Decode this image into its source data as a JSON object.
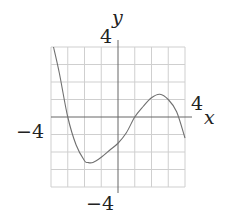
{
  "chart_data": {
    "type": "line",
    "title": "",
    "xlabel": "x",
    "ylabel": "y",
    "xlim": [
      -4,
      4
    ],
    "ylim": [
      -4,
      4
    ],
    "grid": true,
    "grid_step": 1,
    "tick_labels": {
      "x_pos": "4",
      "x_neg": "−4",
      "y_pos": "4",
      "y_neg": "−4"
    },
    "series": [
      {
        "name": "cubic curve",
        "x": [
          -3.85,
          -3.5,
          -3,
          -2.5,
          -2,
          -1.8,
          -1.5,
          -1,
          -0.5,
          0,
          0.5,
          1,
          1.5,
          2,
          2.5,
          3,
          3.5,
          4
        ],
        "y": [
          4.0,
          2.5,
          0,
          -1.6,
          -2.5,
          -2.6,
          -2.6,
          -2.3,
          -1.9,
          -1.5,
          -0.9,
          0,
          0.6,
          1.1,
          1.3,
          1.0,
          0.3,
          -1.2
        ]
      }
    ],
    "colors": {
      "grid": "#c8c8c8",
      "axis": "#555555",
      "curve": "#666666"
    }
  }
}
